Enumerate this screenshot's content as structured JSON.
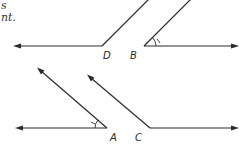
{
  "text_fragments": {
    "line1": "s",
    "line2": "nt."
  },
  "diagram": {
    "vertices": {
      "D": "D",
      "B": "B",
      "A": "A",
      "C": "C"
    },
    "angle_marks": [
      "B",
      "A"
    ]
  }
}
